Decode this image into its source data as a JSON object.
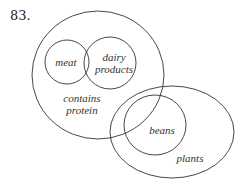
{
  "problem_number": "83.",
  "sets": [
    {
      "id": "contains-protein",
      "label_lines": [
        "contains",
        "protein"
      ],
      "cx": 98,
      "cy": 75,
      "rx": 66,
      "ry": 64
    },
    {
      "id": "meat",
      "label_lines": [
        "meat"
      ],
      "cx": 67,
      "cy": 62,
      "rx": 22,
      "ry": 22
    },
    {
      "id": "dairy-products",
      "label_lines": [
        "dairy",
        "products"
      ],
      "cx": 110,
      "cy": 63,
      "rx": 26,
      "ry": 26
    },
    {
      "id": "plants",
      "label_lines": [
        "plants"
      ],
      "cx": 172,
      "cy": 132,
      "rx": 62,
      "ry": 46
    },
    {
      "id": "beans",
      "label_lines": [
        "beans"
      ],
      "cx": 155,
      "cy": 125,
      "rx": 31,
      "ry": 30
    }
  ],
  "labels": {
    "meat": "meat",
    "dairy_1": "dairy",
    "dairy_2": "products",
    "protein_1": "contains",
    "protein_2": "protein",
    "beans": "beans",
    "plants": "plants"
  },
  "line_color": "#333333"
}
